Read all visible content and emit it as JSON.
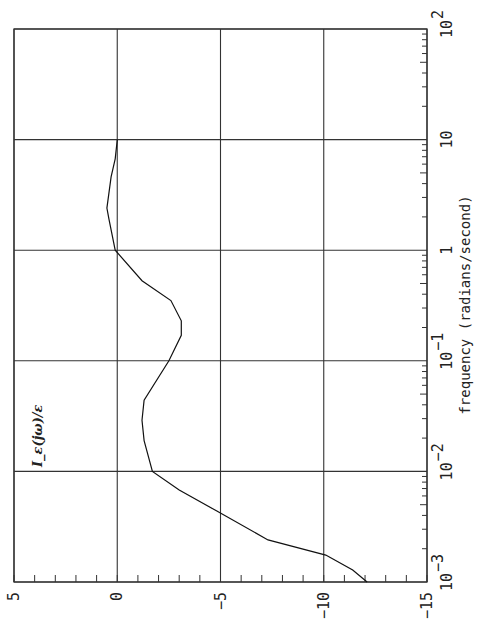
{
  "chart_data": {
    "type": "line",
    "orientation": "rotated 90° (frequency axis vertical on right, value axis horizontal at bottom)",
    "series_label": "I_ε(jω)/ε",
    "xlabel": "frequency (radians/second)",
    "x_scale": "log",
    "xlim": [
      0.001,
      100
    ],
    "x_ticks": [
      {
        "value": 0.001,
        "base": "10",
        "exp": "-3"
      },
      {
        "value": 0.01,
        "base": "10",
        "exp": "-2"
      },
      {
        "value": 0.1,
        "base": "10",
        "exp": "-1"
      },
      {
        "value": 1,
        "base": "1",
        "exp": ""
      },
      {
        "value": 10,
        "base": "10",
        "exp": ""
      },
      {
        "value": 100,
        "base": "10",
        "exp": "2"
      }
    ],
    "ylabel": "",
    "ylim": [
      -15,
      5
    ],
    "y_ticks": [
      "5",
      "0",
      "-5",
      "-10",
      "-15"
    ],
    "y_tick_values": [
      5,
      0,
      -5,
      -10,
      -15
    ],
    "grid": true,
    "series": [
      {
        "name": "I_ε(jω)/ε",
        "x": [
          0.001,
          0.00128,
          0.00175,
          0.0024,
          0.0044,
          0.0068,
          0.01,
          0.019,
          0.029,
          0.044,
          0.1,
          0.17,
          0.23,
          0.35,
          0.53,
          1.0,
          1.9,
          2.4,
          4.6,
          6.7,
          10.0
        ],
        "values": [
          -12.1,
          -11.4,
          -10.1,
          -7.3,
          -4.8,
          -3.0,
          -1.7,
          -1.3,
          -1.2,
          -1.3,
          -2.5,
          -3.1,
          -3.1,
          -2.6,
          -1.2,
          0.1,
          0.4,
          0.5,
          0.3,
          0.1,
          0.0
        ]
      }
    ],
    "legend": null,
    "annotations": [
      "I_ε(jω)/ε"
    ]
  }
}
